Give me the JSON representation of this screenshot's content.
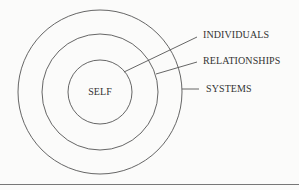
{
  "diagram": {
    "center_label": "SELF",
    "rings": [
      {
        "name": "self",
        "label": "SELF"
      },
      {
        "name": "relationships",
        "label": "RELATIONSHIPS"
      },
      {
        "name": "systems",
        "label": "SYSTEMS"
      }
    ],
    "callouts": {
      "individuals": "INDIVIDUALS",
      "relationships": "RELATIONSHIPS",
      "systems": "SYSTEMS"
    },
    "colors": {
      "stroke": "#555555",
      "text": "#333333",
      "background": "#fbfbfa",
      "rule": "#777777"
    }
  }
}
